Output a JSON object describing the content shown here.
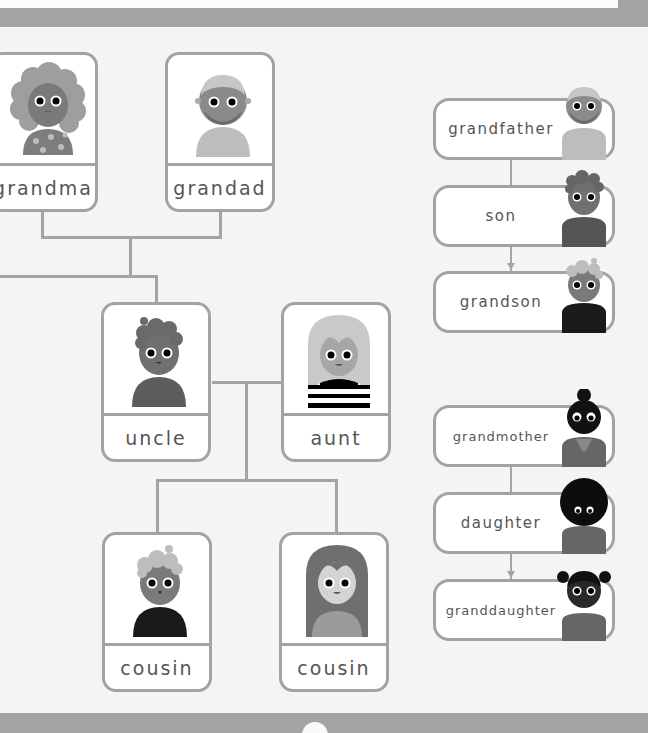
{
  "family_tree": {
    "grandparents": [
      {
        "label": "grandma",
        "avatar": "grandma-avatar"
      },
      {
        "label": "grandad",
        "avatar": "grandad-avatar"
      }
    ],
    "parents": [
      {
        "label": "uncle",
        "avatar": "uncle-avatar"
      },
      {
        "label": "aunt",
        "avatar": "aunt-avatar"
      }
    ],
    "children": [
      {
        "label": "cousin",
        "avatar": "cousin-boy-avatar"
      },
      {
        "label": "cousin",
        "avatar": "cousin-girl-avatar"
      }
    ]
  },
  "male_line": [
    {
      "label": "grandfather",
      "avatar": "grandfather-avatar"
    },
    {
      "label": "son",
      "avatar": "son-avatar"
    },
    {
      "label": "grandson",
      "avatar": "grandson-avatar"
    }
  ],
  "female_line": [
    {
      "label": "grandmother",
      "avatar": "grandmother-avatar"
    },
    {
      "label": "daughter",
      "avatar": "daughter-avatar"
    },
    {
      "label": "granddaughter",
      "avatar": "granddaughter-avatar"
    }
  ],
  "colors": {
    "border": "#a3a3a3",
    "bar": "#a3a3a3",
    "background": "#f4f4f4",
    "card": "#ffffff",
    "text": "#555555"
  }
}
